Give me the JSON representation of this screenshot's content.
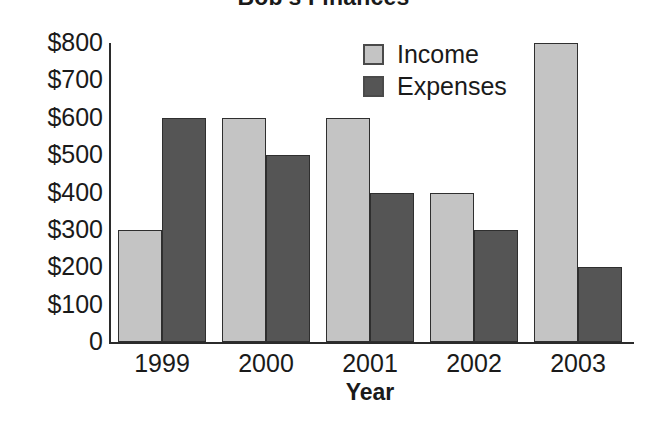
{
  "chart_data": {
    "type": "bar",
    "title": "Bob's Finances",
    "xlabel": "Year",
    "ylabel": "",
    "categories": [
      "1999",
      "2000",
      "2001",
      "2002",
      "2003"
    ],
    "series": [
      {
        "name": "Income",
        "values": [
          300,
          600,
          600,
          400,
          800
        ],
        "color": "#c4c4c4"
      },
      {
        "name": "Expenses",
        "values": [
          600,
          500,
          400,
          300,
          200
        ],
        "color": "#555555"
      }
    ],
    "ylim": [
      0,
      800
    ],
    "ytick_values": [
      0,
      100,
      200,
      300,
      400,
      500,
      600,
      700,
      800
    ],
    "ytick_labels": [
      "0",
      "$100",
      "$200",
      "$300",
      "$400",
      "$500",
      "$600",
      "$700",
      "$800"
    ],
    "grid": false,
    "legend_position": "top-right",
    "axis_color": "#2b2b2b",
    "background": "#ffffff"
  },
  "legend": {
    "entries": [
      {
        "label": "Income",
        "color": "#c4c4c4"
      },
      {
        "label": "Expenses",
        "color": "#555555"
      }
    ]
  }
}
